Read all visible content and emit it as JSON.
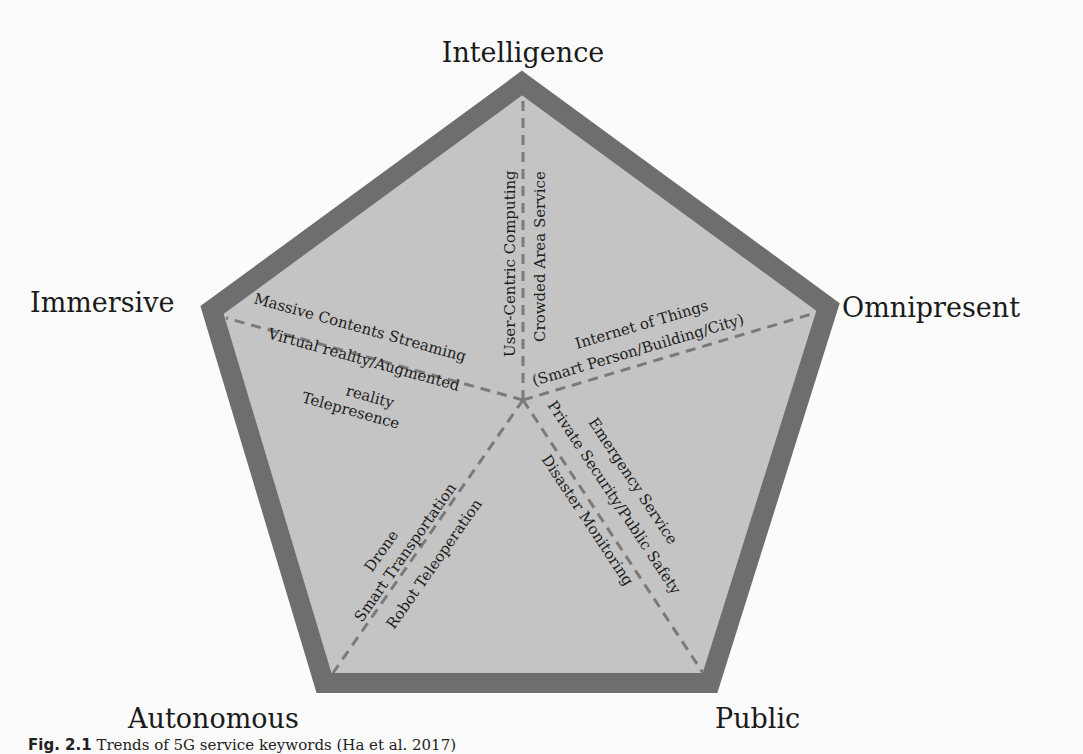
{
  "diagram": {
    "type": "pentagon-concept-map",
    "colors": {
      "outline": "#6e6e6e",
      "fill": "#c4c4c4",
      "dash": "#787878",
      "text": "#1a1a1a"
    },
    "vertices": [
      {
        "label": "Intelligence"
      },
      {
        "label": "Omnipresent"
      },
      {
        "label": "Public"
      },
      {
        "label": "Autonomous"
      },
      {
        "label": "Immersive"
      }
    ],
    "keywords": {
      "intelligence": [
        "User-Centric Computing",
        "Crowded Area Service"
      ],
      "omnipresent": [
        "Internet of Things",
        "(Smart Person/Building/City)"
      ],
      "public": [
        "Emergency Service",
        "Private Security/Public Safety",
        "Disaster Monitoring"
      ],
      "autonomous": [
        "Drone",
        "Smart Transportation",
        "Robot Teleoperation"
      ],
      "immersive": [
        "Massive Contents Streaming",
        "Virtual reality/Augmented",
        "reality",
        "Telepresence"
      ]
    }
  },
  "caption": {
    "label": "Fig. 2.1",
    "text": "Trends of 5G service keywords (Ha et al. 2017)"
  }
}
